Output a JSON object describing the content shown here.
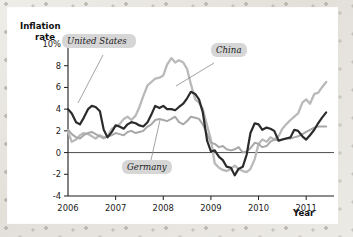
{
  "chart_data": {
    "type": "line",
    "title": "",
    "xlabel": "Year",
    "ylabel": "Inflation rate",
    "xlim": [
      2006.0,
      2011.5
    ],
    "ylim": [
      -4,
      10
    ],
    "grid": false,
    "legend_position": "inline-annotations",
    "x_tick_labels": [
      "2006",
      "2007",
      "2008",
      "2009",
      "2010",
      "2011"
    ],
    "x_ticks": [
      2006,
      2007,
      2008,
      2009,
      2010,
      2011
    ],
    "y_tick_labels": [
      "10%",
      "8",
      "6",
      "4",
      "2",
      "0",
      "-2",
      "-4"
    ],
    "y_ticks": [
      10,
      8,
      6,
      4,
      2,
      0,
      -2,
      -4
    ],
    "zero_line": 0,
    "series": [
      {
        "name": "United States",
        "color": "#2b2b2b",
        "x": [
          2006.0,
          2006.08,
          2006.17,
          2006.25,
          2006.33,
          2006.42,
          2006.5,
          2006.58,
          2006.67,
          2006.75,
          2006.83,
          2006.92,
          2007.0,
          2007.08,
          2007.17,
          2007.25,
          2007.33,
          2007.42,
          2007.5,
          2007.58,
          2007.67,
          2007.75,
          2007.83,
          2007.92,
          2008.0,
          2008.08,
          2008.17,
          2008.25,
          2008.33,
          2008.42,
          2008.5,
          2008.58,
          2008.67,
          2008.75,
          2008.83,
          2008.92,
          2009.0,
          2009.08,
          2009.17,
          2009.25,
          2009.33,
          2009.42,
          2009.5,
          2009.58,
          2009.67,
          2009.75,
          2009.83,
          2009.92,
          2010.0,
          2010.08,
          2010.17,
          2010.25,
          2010.33,
          2010.42,
          2010.5,
          2010.58,
          2010.67,
          2010.75,
          2010.83,
          2010.92,
          2011.0,
          2011.08,
          2011.17,
          2011.25,
          2011.33,
          2011.42
        ],
        "values": [
          4.0,
          3.6,
          2.8,
          2.6,
          3.2,
          4.0,
          4.3,
          4.2,
          3.8,
          2.1,
          1.4,
          1.9,
          2.5,
          2.4,
          2.2,
          2.6,
          2.8,
          2.7,
          2.5,
          2.4,
          2.8,
          3.5,
          4.3,
          4.1,
          4.3,
          4.0,
          4.0,
          3.9,
          4.2,
          4.5,
          5.0,
          5.6,
          5.4,
          4.9,
          3.7,
          1.1,
          0.1,
          0.2,
          -0.4,
          -0.7,
          -1.3,
          -1.4,
          -2.1,
          -1.5,
          -1.3,
          -0.2,
          1.8,
          2.7,
          2.6,
          2.1,
          2.3,
          2.2,
          2.0,
          1.1,
          1.2,
          1.3,
          1.4,
          2.1,
          2.0,
          1.5,
          1.2,
          1.6,
          2.1,
          2.7,
          3.2,
          3.7
        ]
      },
      {
        "name": "China",
        "color": "#b9b9b9",
        "x": [
          2006.0,
          2006.08,
          2006.17,
          2006.25,
          2006.33,
          2006.42,
          2006.5,
          2006.58,
          2006.67,
          2006.75,
          2006.83,
          2006.92,
          2007.0,
          2007.08,
          2007.17,
          2007.25,
          2007.33,
          2007.42,
          2007.5,
          2007.58,
          2007.67,
          2007.75,
          2007.83,
          2007.92,
          2008.0,
          2008.08,
          2008.17,
          2008.25,
          2008.33,
          2008.42,
          2008.5,
          2008.58,
          2008.67,
          2008.75,
          2008.83,
          2008.92,
          2009.0,
          2009.08,
          2009.17,
          2009.25,
          2009.33,
          2009.42,
          2009.5,
          2009.58,
          2009.67,
          2009.75,
          2009.83,
          2009.92,
          2010.0,
          2010.08,
          2010.17,
          2010.25,
          2010.33,
          2010.42,
          2010.5,
          2010.58,
          2010.67,
          2010.75,
          2010.83,
          2010.92,
          2011.0,
          2011.08,
          2011.17,
          2011.25,
          2011.33,
          2011.42
        ],
        "values": [
          1.9,
          1.0,
          1.2,
          1.6,
          1.8,
          1.7,
          1.5,
          1.3,
          1.6,
          1.4,
          1.5,
          2.2,
          2.4,
          2.6,
          3.1,
          3.3,
          3.0,
          3.4,
          4.2,
          5.2,
          6.2,
          6.5,
          6.8,
          6.9,
          7.1,
          8.1,
          8.7,
          8.3,
          8.5,
          8.3,
          7.7,
          6.3,
          4.9,
          4.6,
          4.0,
          2.5,
          1.2,
          -1.0,
          -1.4,
          -1.6,
          -1.7,
          -1.5,
          -1.2,
          -1.5,
          -1.7,
          -1.8,
          -1.5,
          -0.6,
          0.8,
          1.2,
          1.0,
          1.4,
          1.2,
          1.5,
          2.2,
          2.6,
          3.0,
          3.3,
          3.6,
          4.6,
          4.9,
          4.5,
          5.4,
          5.5,
          6.0,
          6.5
        ]
      },
      {
        "name": "Germany",
        "color": "#a8a8a8",
        "x": [
          2006.0,
          2006.08,
          2006.17,
          2006.25,
          2006.33,
          2006.42,
          2006.5,
          2006.58,
          2006.67,
          2006.75,
          2006.83,
          2006.92,
          2007.0,
          2007.08,
          2007.17,
          2007.25,
          2007.33,
          2007.42,
          2007.5,
          2007.58,
          2007.67,
          2007.75,
          2007.83,
          2007.92,
          2008.0,
          2008.08,
          2008.17,
          2008.25,
          2008.33,
          2008.42,
          2008.5,
          2008.58,
          2008.67,
          2008.75,
          2008.83,
          2008.92,
          2009.0,
          2009.08,
          2009.17,
          2009.25,
          2009.33,
          2009.42,
          2009.5,
          2009.58,
          2009.67,
          2009.75,
          2009.83,
          2009.92,
          2010.0,
          2010.08,
          2010.17,
          2010.25,
          2010.33,
          2010.42,
          2010.5,
          2010.58,
          2010.67,
          2010.75,
          2010.83,
          2010.92,
          2011.0,
          2011.08,
          2011.17,
          2011.25,
          2011.33,
          2011.42
        ],
        "values": [
          2.1,
          1.7,
          1.4,
          1.3,
          1.6,
          1.8,
          1.9,
          1.7,
          1.5,
          1.3,
          1.5,
          1.6,
          1.8,
          1.7,
          1.6,
          1.9,
          2.0,
          1.8,
          1.9,
          2.0,
          2.4,
          2.6,
          3.0,
          3.1,
          3.0,
          2.9,
          3.1,
          3.3,
          2.8,
          2.6,
          2.9,
          3.3,
          3.2,
          3.1,
          2.6,
          1.7,
          0.9,
          0.8,
          0.5,
          0.6,
          0.3,
          0.2,
          0.3,
          0.5,
          0.0,
          0.1,
          0.4,
          0.9,
          0.8,
          0.5,
          0.6,
          1.0,
          1.2,
          1.1,
          1.2,
          1.3,
          1.3,
          1.4,
          1.5,
          1.7,
          1.9,
          2.1,
          2.3,
          2.4,
          2.4,
          2.4
        ]
      }
    ],
    "annotations": [
      {
        "label": "United States",
        "series": "United States"
      },
      {
        "label": "China",
        "series": "China"
      },
      {
        "label": "Germany",
        "series": "Germany"
      }
    ]
  }
}
